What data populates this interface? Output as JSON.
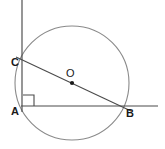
{
  "diagram": {
    "canvas": {
      "width": 165,
      "height": 149,
      "background": "#ffffff"
    },
    "colors": {
      "line": "#4a4a4a",
      "circle": "#8a8a8a",
      "label": "#1a1a1a",
      "background": "#ffffff"
    },
    "circle": {
      "name": "main-circle",
      "center_x": 72,
      "center_y": 83,
      "radius": 57,
      "stroke": "#8a8a8a"
    },
    "center_point": {
      "label": "O",
      "x": 72,
      "y": 83,
      "label_x": 66,
      "label_y": 77
    },
    "points": [
      {
        "id": "A",
        "label": "A",
        "x": 22,
        "y": 107,
        "label_x": 11,
        "label_y": 115
      },
      {
        "id": "B",
        "label": "B",
        "x": 124,
        "y": 106,
        "label_x": 126,
        "label_y": 117
      },
      {
        "id": "C",
        "label": "C",
        "x": 22,
        "y": 61,
        "label_x": 11,
        "label_y": 66
      }
    ],
    "segments": [
      {
        "id": "vertical-line",
        "label": "vertical line through A and C",
        "x1": 22,
        "y1": 0,
        "x2": 22,
        "y2": 112
      },
      {
        "id": "horizontal-line",
        "label": "horizontal line through A and B",
        "x1": 21,
        "y1": 106,
        "x2": 158,
        "y2": 106
      },
      {
        "id": "chord-CB",
        "label": "diameter C to B through O",
        "x1": 16,
        "y1": 57,
        "x2": 131,
        "y2": 111
      }
    ],
    "right_angle": {
      "label": "right angle at A",
      "vertex_x": 22,
      "vertex_y": 106,
      "size": 11
    }
  }
}
